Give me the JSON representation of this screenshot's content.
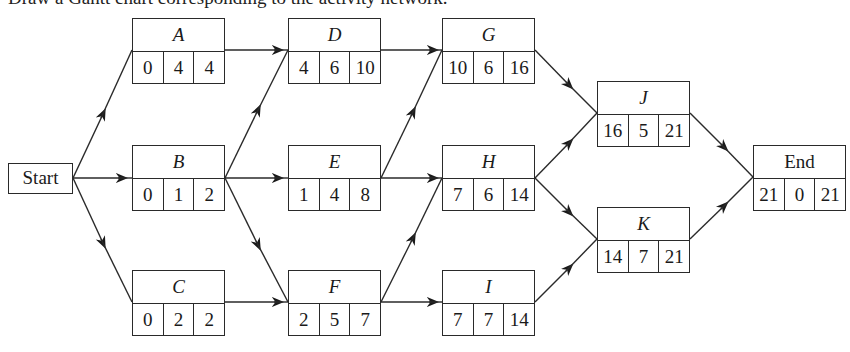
{
  "caption": "Draw a Gantt chart corresponding to the activity network.",
  "start": {
    "label": "Start"
  },
  "nodes": {
    "A": {
      "label": "A",
      "values": [
        "0",
        "4",
        "4"
      ]
    },
    "B": {
      "label": "B",
      "values": [
        "0",
        "1",
        "2"
      ]
    },
    "C": {
      "label": "C",
      "values": [
        "0",
        "2",
        "2"
      ]
    },
    "D": {
      "label": "D",
      "values": [
        "4",
        "6",
        "10"
      ]
    },
    "E": {
      "label": "E",
      "values": [
        "1",
        "4",
        "8"
      ]
    },
    "F": {
      "label": "F",
      "values": [
        "2",
        "5",
        "7"
      ]
    },
    "G": {
      "label": "G",
      "values": [
        "10",
        "6",
        "16"
      ]
    },
    "H": {
      "label": "H",
      "values": [
        "7",
        "6",
        "14"
      ]
    },
    "I": {
      "label": "I",
      "values": [
        "7",
        "7",
        "14"
      ]
    },
    "J": {
      "label": "J",
      "values": [
        "16",
        "5",
        "21"
      ]
    },
    "K": {
      "label": "K",
      "values": [
        "14",
        "7",
        "21"
      ]
    },
    "End": {
      "label": "End",
      "values": [
        "21",
        "0",
        "21"
      ]
    }
  },
  "edges": [
    [
      "Start",
      "A"
    ],
    [
      "Start",
      "B"
    ],
    [
      "Start",
      "C"
    ],
    [
      "A",
      "D"
    ],
    [
      "B",
      "D"
    ],
    [
      "B",
      "E"
    ],
    [
      "B",
      "F"
    ],
    [
      "C",
      "F"
    ],
    [
      "D",
      "G"
    ],
    [
      "E",
      "G"
    ],
    [
      "E",
      "H"
    ],
    [
      "F",
      "H"
    ],
    [
      "F",
      "I"
    ],
    [
      "G",
      "J"
    ],
    [
      "H",
      "J"
    ],
    [
      "H",
      "K"
    ],
    [
      "I",
      "K"
    ],
    [
      "J",
      "End"
    ],
    [
      "K",
      "End"
    ]
  ],
  "colors": {
    "line": "#2a2a2a",
    "background": "#ffffff"
  }
}
